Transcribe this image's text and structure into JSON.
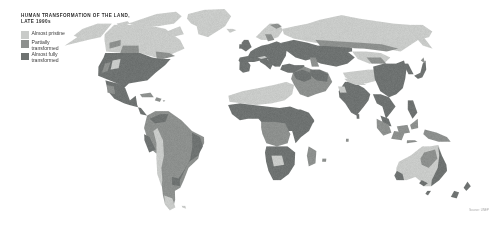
{
  "figure": {
    "kind": "thematic-world-map",
    "background_color": "#fdfdfd",
    "ocean_color": "#ffffff"
  },
  "title": {
    "line1": "HUMAN TRANSFORMATION OF THE LAND,",
    "line2": "LATE 1990s"
  },
  "legend": {
    "items": [
      {
        "label_line1": "Almost pristine",
        "label_line2": "",
        "color": "#c9cbc9"
      },
      {
        "label_line1": "Partially",
        "label_line2": "transformed",
        "color": "#8d908e"
      },
      {
        "label_line1": "Almost fully",
        "label_line2": "transformed",
        "color": "#6e7271"
      }
    ]
  },
  "source": {
    "text": "Source: UNEP"
  },
  "chart_data": {
    "type": "map",
    "title": "HUMAN TRANSFORMATION OF THE LAND, LATE 1990s",
    "projection": "robinson",
    "categories": [
      "Almost pristine",
      "Partially transformed",
      "Almost fully transformed"
    ],
    "colors": [
      "#c9cbc9",
      "#8d908e",
      "#6e7271"
    ],
    "regions": [
      {
        "name": "Greenland",
        "class": "Almost pristine"
      },
      {
        "name": "Arctic Canada",
        "class": "Almost pristine"
      },
      {
        "name": "Alaska",
        "class": "Almost pristine"
      },
      {
        "name": "Canadian boreal",
        "class": "Almost pristine"
      },
      {
        "name": "United States",
        "class": "Almost fully transformed"
      },
      {
        "name": "Mexico / Central America",
        "class": "Almost fully transformed"
      },
      {
        "name": "Amazon basin",
        "class": "Partially transformed"
      },
      {
        "name": "Brazilian coast / Pampas",
        "class": "Almost fully transformed"
      },
      {
        "name": "Andes / Patagonia",
        "class": "Partially transformed"
      },
      {
        "name": "Western Europe",
        "class": "Almost fully transformed"
      },
      {
        "name": "Scandinavia",
        "class": "Almost pristine"
      },
      {
        "name": "Sahara",
        "class": "Almost pristine"
      },
      {
        "name": "Sahel / West Africa",
        "class": "Almost fully transformed"
      },
      {
        "name": "Congo basin",
        "class": "Partially transformed"
      },
      {
        "name": "East / Southern Africa",
        "class": "Almost fully transformed"
      },
      {
        "name": "Arabian Peninsula",
        "class": "Partially transformed"
      },
      {
        "name": "Siberia",
        "class": "Almost pristine"
      },
      {
        "name": "Central Asia steppe",
        "class": "Almost fully transformed"
      },
      {
        "name": "Tibetan Plateau",
        "class": "Almost pristine"
      },
      {
        "name": "India",
        "class": "Almost fully transformed"
      },
      {
        "name": "Eastern China",
        "class": "Almost fully transformed"
      },
      {
        "name": "Southeast Asia",
        "class": "Almost fully transformed"
      },
      {
        "name": "Indonesia / New Guinea",
        "class": "Partially transformed"
      },
      {
        "name": "Australian interior",
        "class": "Almost pristine"
      },
      {
        "name": "Australian east / southwest",
        "class": "Almost fully transformed"
      },
      {
        "name": "New Zealand",
        "class": "Almost fully transformed"
      }
    ]
  }
}
